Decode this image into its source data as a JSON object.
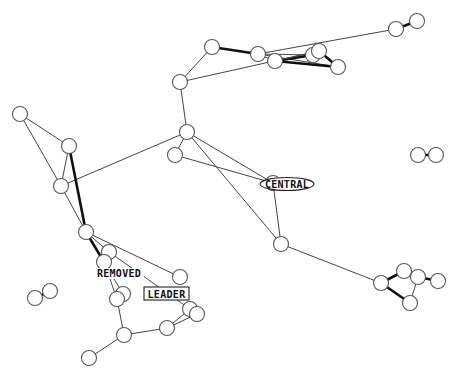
{
  "diagram": {
    "type": "network-graph",
    "node_radius": 7.5,
    "labels": {
      "central": "CENTRAL",
      "removed": "REMOVED",
      "leader": "LEADER"
    },
    "nodes": [
      {
        "id": "n1",
        "x": 212,
        "y": 47
      },
      {
        "id": "n2",
        "x": 180,
        "y": 82
      },
      {
        "id": "n3",
        "x": 258,
        "y": 54
      },
      {
        "id": "n4",
        "x": 275,
        "y": 61
      },
      {
        "id": "n5",
        "x": 313,
        "y": 55
      },
      {
        "id": "n6",
        "x": 319,
        "y": 51
      },
      {
        "id": "n7",
        "x": 338,
        "y": 67
      },
      {
        "id": "n8",
        "x": 396,
        "y": 29
      },
      {
        "id": "n9",
        "x": 417,
        "y": 21
      },
      {
        "id": "n10",
        "x": 187,
        "y": 132
      },
      {
        "id": "n11",
        "x": 175,
        "y": 155
      },
      {
        "id": "n12",
        "x": 20,
        "y": 114
      },
      {
        "id": "n13",
        "x": 69,
        "y": 146
      },
      {
        "id": "n14",
        "x": 61,
        "y": 186
      },
      {
        "id": "n15",
        "x": 86,
        "y": 232
      },
      {
        "id": "n16",
        "x": 109,
        "y": 252
      },
      {
        "id": "n17",
        "x": 104,
        "y": 262
      },
      {
        "id": "n18",
        "x": 180,
        "y": 277
      },
      {
        "id": "n19",
        "x": 123,
        "y": 294
      },
      {
        "id": "n20",
        "x": 117,
        "y": 299
      },
      {
        "id": "n21",
        "x": 190,
        "y": 309
      },
      {
        "id": "n22",
        "x": 197,
        "y": 314
      },
      {
        "id": "n23",
        "x": 167,
        "y": 328
      },
      {
        "id": "n24",
        "x": 124,
        "y": 335
      },
      {
        "id": "n25",
        "x": 89,
        "y": 358
      },
      {
        "id": "n26",
        "x": 35,
        "y": 298
      },
      {
        "id": "n27",
        "x": 50,
        "y": 291
      },
      {
        "id": "n28",
        "x": 281,
        "y": 244
      },
      {
        "id": "n29",
        "x": 273,
        "y": 183
      },
      {
        "id": "n30",
        "x": 418,
        "y": 155
      },
      {
        "id": "n31",
        "x": 436,
        "y": 155
      },
      {
        "id": "n32",
        "x": 381,
        "y": 283
      },
      {
        "id": "n33",
        "x": 404,
        "y": 271
      },
      {
        "id": "n34",
        "x": 418,
        "y": 277
      },
      {
        "id": "n35",
        "x": 438,
        "y": 281
      },
      {
        "id": "n36",
        "x": 410,
        "y": 303
      }
    ],
    "edges": [
      {
        "from": "n1",
        "to": "n2",
        "weight": "thin"
      },
      {
        "from": "n1",
        "to": "n3",
        "weight": "thick"
      },
      {
        "from": "n3",
        "to": "n4",
        "weight": "thin"
      },
      {
        "from": "n3",
        "to": "n5",
        "weight": "thin"
      },
      {
        "from": "n3",
        "to": "n7",
        "weight": "thin"
      },
      {
        "from": "n4",
        "to": "n5",
        "weight": "thick"
      },
      {
        "from": "n4",
        "to": "n6",
        "weight": "thin"
      },
      {
        "from": "n4",
        "to": "n7",
        "weight": "thick"
      },
      {
        "from": "n6",
        "to": "n7",
        "weight": "thick"
      },
      {
        "from": "n3",
        "to": "n8",
        "weight": "thin"
      },
      {
        "from": "n8",
        "to": "n9",
        "weight": "thick"
      },
      {
        "from": "n2",
        "to": "n6",
        "weight": "thin"
      },
      {
        "from": "n2",
        "to": "n10",
        "weight": "thin"
      },
      {
        "from": "n10",
        "to": "n11",
        "weight": "thin"
      },
      {
        "from": "n10",
        "to": "n29",
        "weight": "thin"
      },
      {
        "from": "n11",
        "to": "n29",
        "weight": "thin"
      },
      {
        "from": "n10",
        "to": "n28",
        "weight": "thin"
      },
      {
        "from": "n29",
        "to": "n28",
        "weight": "thin"
      },
      {
        "from": "n28",
        "to": "n32",
        "weight": "thin"
      },
      {
        "from": "n10",
        "to": "n14",
        "weight": "thin"
      },
      {
        "from": "n12",
        "to": "n13",
        "weight": "thin"
      },
      {
        "from": "n12",
        "to": "n14",
        "weight": "thin"
      },
      {
        "from": "n13",
        "to": "n14",
        "weight": "thin"
      },
      {
        "from": "n13",
        "to": "n15",
        "weight": "thick"
      },
      {
        "from": "n14",
        "to": "n15",
        "weight": "thin"
      },
      {
        "from": "n15",
        "to": "n16",
        "weight": "thin"
      },
      {
        "from": "n15",
        "to": "n17",
        "weight": "thick"
      },
      {
        "from": "n15",
        "to": "n18",
        "weight": "thin"
      },
      {
        "from": "n16",
        "to": "n21",
        "weight": "thin"
      },
      {
        "from": "n17",
        "to": "n19",
        "weight": "thin"
      },
      {
        "from": "n17",
        "to": "n20",
        "weight": "thin"
      },
      {
        "from": "n20",
        "to": "n24",
        "weight": "thin"
      },
      {
        "from": "n24",
        "to": "n23",
        "weight": "thin"
      },
      {
        "from": "n24",
        "to": "n25",
        "weight": "thin"
      },
      {
        "from": "n23",
        "to": "n21",
        "weight": "thin"
      },
      {
        "from": "n23",
        "to": "n22",
        "weight": "thin"
      },
      {
        "from": "n26",
        "to": "n27",
        "weight": "thick"
      },
      {
        "from": "n30",
        "to": "n31",
        "weight": "thick"
      },
      {
        "from": "n32",
        "to": "n33",
        "weight": "thick"
      },
      {
        "from": "n32",
        "to": "n36",
        "weight": "thick"
      },
      {
        "from": "n33",
        "to": "n34",
        "weight": "thin"
      },
      {
        "from": "n34",
        "to": "n35",
        "weight": "thick"
      },
      {
        "from": "n34",
        "to": "n36",
        "weight": "thin"
      }
    ]
  }
}
